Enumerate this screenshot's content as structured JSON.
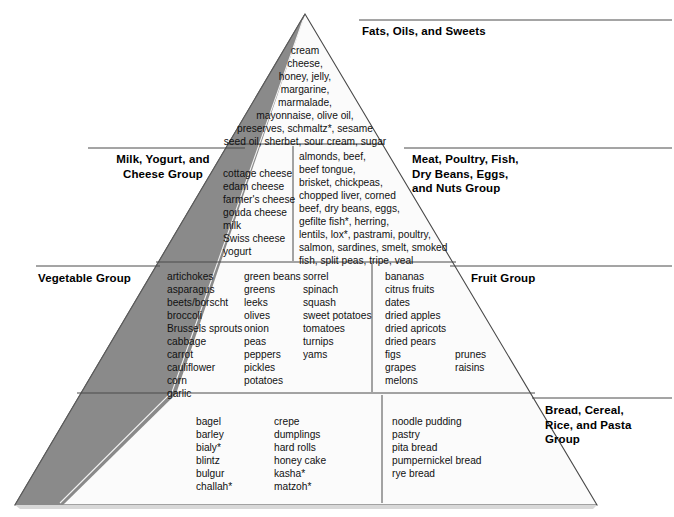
{
  "diagram": {
    "type": "food-pyramid",
    "apex_color": "#ffffff",
    "shadow_color": "#8a8a8a",
    "outline_color": "#4a4a4a"
  },
  "groups": {
    "fats": {
      "label": "Fats, Oils, and Sweets",
      "items_text": "cream\ncheese,\nhoney, jelly,\nmargarine,\nmarmalade,\nmayonnaise, olive oil,\npreserves, schmaltz*, sesame\nseed oil, sherbet, sour cream, sugar",
      "items": [
        "cream",
        "cheese",
        "honey",
        "jelly",
        "margarine",
        "marmalade",
        "mayonnaise",
        "olive oil",
        "preserves",
        "schmaltz*",
        "sesame seed oil",
        "sherbet",
        "sour cream",
        "sugar"
      ]
    },
    "milk": {
      "label": "Milk, Yogurt, and\nCheese Group",
      "items_text": "cottage cheese\nedam cheese\nfarmer's cheese\ngouda cheese\nmilk\nSwiss cheese\nyogurt",
      "items": [
        "cottage cheese",
        "edam cheese",
        "farmer's cheese",
        "gouda cheese",
        "milk",
        "Swiss cheese",
        "yogurt"
      ]
    },
    "meat": {
      "label": "Meat, Poultry, Fish,\nDry Beans, Eggs,\nand Nuts Group",
      "items_text": "almonds, beef,\nbeef tongue,\nbrisket, chickpeas,\nchopped liver, corned\nbeef, dry beans, eggs,\ngefilte fish*, herring,\nlentils, lox*, pastrami, poultry,\nsalmon, sardines, smelt, smoked\nfish, split peas, tripe, veal",
      "items": [
        "almonds",
        "beef",
        "beef tongue",
        "brisket",
        "chickpeas",
        "chopped liver",
        "corned beef",
        "dry beans",
        "eggs",
        "gefilte fish*",
        "herring",
        "lentils",
        "lox*",
        "pastrami",
        "poultry",
        "salmon",
        "sardines",
        "smelt",
        "smoked fish",
        "split peas",
        "tripe",
        "veal"
      ]
    },
    "vegetable": {
      "label": "Vegetable Group",
      "col1_text": "artichokes\nasparagus\nbeets/borscht\nbroccoli\nBrussels sprouts\ncabbage\ncarrot\ncauliflower\ncorn\ngarlic",
      "col2_text": "green beans\ngreens\nleeks\nolives\nonion\npeas\npeppers\npickles\npotatoes",
      "col3_text": "sorrel\nspinach\nsquash\nsweet potatoes\ntomatoes\nturnips\nyams",
      "col1": [
        "artichokes",
        "asparagus",
        "beets/borscht",
        "broccoli",
        "Brussels sprouts",
        "cabbage",
        "carrot",
        "cauliflower",
        "corn",
        "garlic"
      ],
      "col2": [
        "green beans",
        "greens",
        "leeks",
        "olives",
        "onion",
        "peas",
        "peppers",
        "pickles",
        "potatoes"
      ],
      "col3": [
        "sorrel",
        "spinach",
        "squash",
        "sweet potatoes",
        "tomatoes",
        "turnips",
        "yams"
      ]
    },
    "fruit": {
      "label": "Fruit Group",
      "col1_text": "bananas\ncitrus fruits\ndates\ndried apples\ndried apricots\ndried pears\nfigs\ngrapes\nmelons",
      "col2_text": "prunes\nraisins",
      "col1": [
        "bananas",
        "citrus fruits",
        "dates",
        "dried apples",
        "dried apricots",
        "dried pears",
        "figs",
        "grapes",
        "melons"
      ],
      "col2": [
        "prunes",
        "raisins"
      ]
    },
    "bread": {
      "label": "Bread, Cereal,\nRice, and Pasta\nGroup",
      "col1_text": "bagel\nbarley\nbialy*\nblintz\nbulgur\nchallah*",
      "col2_text": "crepe\ndumplings\nhard rolls\nhoney cake\nkasha*\nmatzoh*",
      "col3_text": "noodle pudding\npastry\npita bread\npumpernickel bread\nrye bread",
      "col1": [
        "bagel",
        "barley",
        "bialy*",
        "blintz",
        "bulgur",
        "challah*"
      ],
      "col2": [
        "crepe",
        "dumplings",
        "hard rolls",
        "honey cake",
        "kasha*",
        "matzoh*"
      ],
      "col3": [
        "noodle pudding",
        "pastry",
        "pita bread",
        "pumpernickel bread",
        "rye bread"
      ]
    }
  }
}
